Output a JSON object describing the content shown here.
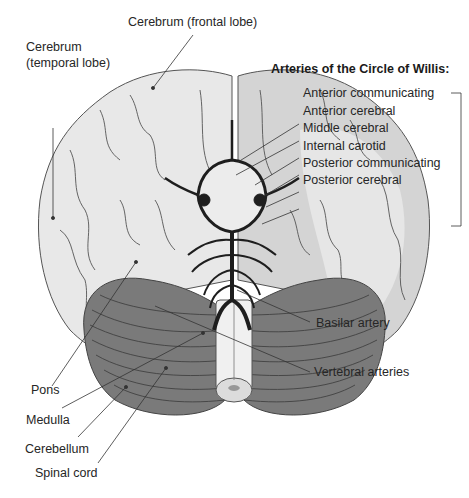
{
  "title": "Arteries of the Circle of Willis:",
  "labels": {
    "frontal": "Cerebrum (frontal lobe)",
    "temporal_1": "Cerebrum",
    "temporal_2": "(temporal lobe)",
    "basilar": "Basilar artery",
    "vertebral": "Vertebral arteries",
    "pons": "Pons",
    "medulla": "Medulla",
    "cerebellum": "Cerebellum",
    "spinal": "Spinal cord"
  },
  "arteries": [
    "Anterior communicating",
    "Anterior cerebral",
    "Middle cerebral",
    "Internal carotid",
    "Posterior communicating",
    "Posterior cerebral"
  ],
  "colors": {
    "cerebrum_light": "#e9e9e9",
    "cerebrum_shade": "#c9c9c9",
    "cerebellum": "#7a7a7a",
    "arteries": "#1e1e1e",
    "leader_lines": "#333333"
  }
}
